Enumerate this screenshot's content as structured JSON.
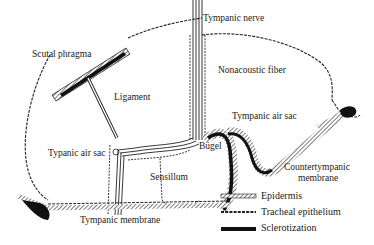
{
  "labels": {
    "tympanic_nerve": "Tympanic nerve",
    "scutal_phragma": "Scutal phragma",
    "nonacoustic_fiber": "Nonacoustic fiber",
    "ligament": "Ligament",
    "tympanic_air_sac_right": "Tympanic air sac",
    "typanic_air_sac_left": "Typanic air sac",
    "bugel": "Bügel",
    "sensillum": "Sensillum",
    "countertympanic_line1": "Countertympanic",
    "countertympanic_line2": "membrane",
    "tympanic_membrane": "Tympanic membrane"
  },
  "legend": [
    {
      "key": "epidermis",
      "label": "Epidermis"
    },
    {
      "key": "tracheal_epithelium",
      "label": "Tracheal epithelium"
    },
    {
      "key": "sclerotization",
      "label": "Sclerotization"
    }
  ],
  "colors": {
    "ink": "#1a1a1a",
    "background": "#ffffff"
  }
}
